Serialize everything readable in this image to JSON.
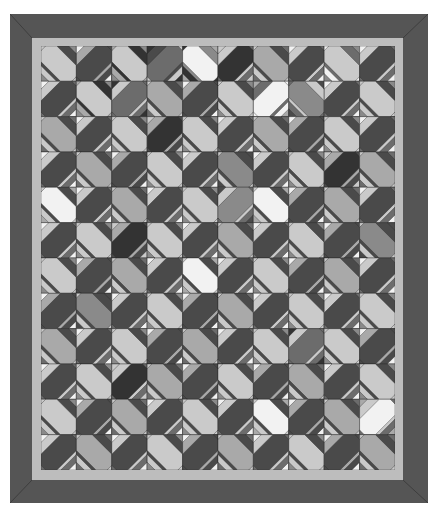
{
  "quilt": {
    "columns": 10,
    "rows": 12,
    "colors": {
      "outer_border": "#555555",
      "inner_border": "#bdbdbd",
      "palette": [
        "#f2f2f2",
        "#cacaca",
        "#a9a9a9",
        "#8a8a8a",
        "#6c6c6c",
        "#4a4a4a",
        "#333333"
      ]
    },
    "band_colors": [
      [
        1,
        5,
        1,
        4,
        0,
        6,
        2,
        5,
        1,
        5
      ],
      [
        5,
        1,
        4,
        2,
        5,
        1,
        0,
        3,
        5,
        1
      ],
      [
        2,
        5,
        1,
        6,
        1,
        5,
        2,
        5,
        1,
        5
      ],
      [
        5,
        2,
        5,
        1,
        5,
        3,
        5,
        1,
        6,
        2
      ],
      [
        0,
        5,
        2,
        5,
        1,
        3,
        0,
        5,
        2,
        5
      ],
      [
        5,
        1,
        6,
        1,
        5,
        2,
        5,
        1,
        5,
        3
      ],
      [
        1,
        5,
        2,
        5,
        0,
        5,
        1,
        5,
        2,
        5
      ],
      [
        5,
        3,
        5,
        1,
        5,
        2,
        5,
        1,
        5,
        1
      ],
      [
        2,
        5,
        1,
        5,
        2,
        5,
        1,
        4,
        1,
        5
      ],
      [
        5,
        1,
        6,
        2,
        5,
        1,
        5,
        2,
        5,
        1
      ],
      [
        1,
        5,
        2,
        5,
        1,
        5,
        0,
        5,
        2,
        0
      ],
      [
        5,
        2,
        5,
        1,
        5,
        2,
        5,
        1,
        5,
        2
      ]
    ],
    "side_colors": [
      [
        5,
        2,
        6,
        5,
        3,
        1,
        5,
        1,
        4,
        1
      ],
      [
        1,
        6,
        1,
        5,
        2,
        5,
        4,
        1,
        1,
        5
      ],
      [
        5,
        1,
        5,
        2,
        5,
        1,
        5,
        2,
        5,
        1
      ],
      [
        1,
        5,
        2,
        5,
        1,
        5,
        1,
        5,
        2,
        5
      ],
      [
        5,
        1,
        5,
        1,
        5,
        1,
        5,
        2,
        5,
        1
      ],
      [
        1,
        5,
        2,
        5,
        1,
        5,
        1,
        5,
        2,
        5
      ],
      [
        5,
        2,
        5,
        1,
        5,
        1,
        5,
        2,
        5,
        1
      ],
      [
        2,
        5,
        1,
        5,
        2,
        5,
        1,
        5,
        1,
        5
      ],
      [
        5,
        1,
        5,
        2,
        5,
        1,
        5,
        1,
        5,
        2
      ],
      [
        1,
        5,
        1,
        5,
        2,
        5,
        2,
        5,
        1,
        5
      ],
      [
        5,
        2,
        5,
        1,
        5,
        1,
        5,
        2,
        5,
        1
      ],
      [
        1,
        5,
        1,
        5,
        2,
        5,
        1,
        5,
        2,
        5
      ]
    ]
  }
}
